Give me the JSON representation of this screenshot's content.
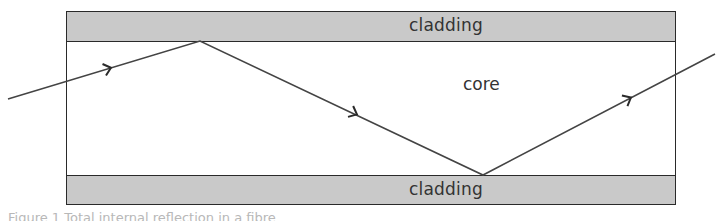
{
  "diagram": {
    "labels": {
      "top_cladding": "cladding",
      "core": "core",
      "bottom_cladding": "cladding"
    },
    "colors": {
      "cladding_fill": "#c9c9c9",
      "outline": "#2a2a2a",
      "ray": "#444444",
      "text": "#333333"
    },
    "ray_path": [
      {
        "x": 8,
        "y": 99
      },
      {
        "x": 200,
        "y": 41
      },
      {
        "x": 483,
        "y": 175
      },
      {
        "x": 715,
        "y": 54
      }
    ],
    "arrows": [
      {
        "x": 110,
        "y": 68,
        "direction": "right-up"
      },
      {
        "x": 356,
        "y": 114,
        "direction": "right-down"
      },
      {
        "x": 630,
        "y": 98,
        "direction": "right-up"
      }
    ],
    "caption": "Figure 1  Total internal reflection in a fibre"
  }
}
